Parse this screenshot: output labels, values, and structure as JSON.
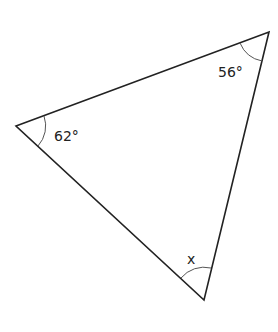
{
  "diagram": {
    "type": "triangle",
    "angles": [
      {
        "vertex": "left",
        "label": "62°"
      },
      {
        "vertex": "top-right",
        "label": "56°"
      },
      {
        "vertex": "bottom",
        "label": "x"
      }
    ],
    "colors": {
      "stroke": "#222222",
      "background": "#ffffff"
    }
  }
}
